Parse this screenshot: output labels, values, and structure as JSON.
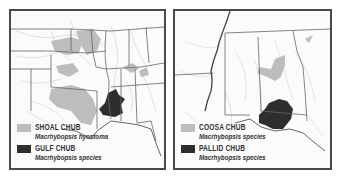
{
  "colors": {
    "border": "#4a4a4a",
    "background": "#fbfbfb",
    "light_range": "#bdbdbd",
    "dark_range": "#2e2e2e",
    "state_lines": "#666666",
    "rivers": "#c4c4c4"
  },
  "maps": [
    {
      "id": "left",
      "region": "Central and southeastern United States",
      "legend": [
        {
          "common_name": "SHOAL CHUB",
          "scientific_name": "Macrhybopsis hyostoma",
          "swatch": "light"
        },
        {
          "common_name": "GULF CHUB",
          "scientific_name": "Macrhybopsis species",
          "swatch": "dark"
        }
      ]
    },
    {
      "id": "right",
      "region": "Mississippi, Alabama and Georgia",
      "legend": [
        {
          "common_name": "COOSA CHUB",
          "scientific_name": "Macrhybopsis species",
          "swatch": "light"
        },
        {
          "common_name": "PALLID CHUB",
          "scientific_name": "Macrhybopsis species",
          "swatch": "dark"
        }
      ]
    }
  ]
}
